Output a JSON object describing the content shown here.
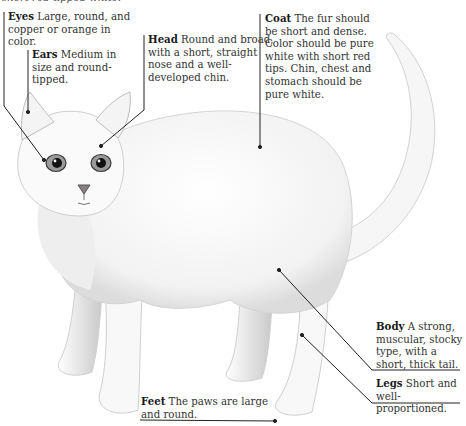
{
  "top_fragment": "short red-tipped white.",
  "callouts": [
    {
      "id": "eyes",
      "term": "Eyes",
      "text": "Large, round, and copper or orange in color."
    },
    {
      "id": "ears",
      "term": "Ears",
      "text": "Medium in size and round-tipped."
    },
    {
      "id": "head",
      "term": "Head",
      "text": "Round and broad, with a short, straight nose and a well-developed chin."
    },
    {
      "id": "coat",
      "term": "Coat",
      "text": "The fur should be short and dense. Color should be pure white with short red tips. Chin, chest and stomach should be pure white."
    },
    {
      "id": "body",
      "term": "Body",
      "text": "A strong, muscular, stocky type, with a short, thick tail."
    },
    {
      "id": "legs",
      "term": "Legs",
      "text": "Short and well-proportioned."
    },
    {
      "id": "feet",
      "term": "Feet",
      "text": "The paws are large and round."
    }
  ],
  "colors": {
    "background": "#ffffff",
    "ink": "#2a2a2a",
    "fur_shade": "#c8c8c8",
    "eye": "#6b6b6b"
  }
}
